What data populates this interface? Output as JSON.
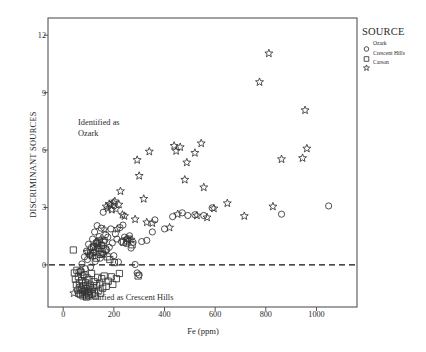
{
  "chart_data": {
    "type": "scatter",
    "title": "",
    "xlabel": "Fe (ppm)",
    "ylabel": "DISCRIMINANT SOURCES",
    "xlim": [
      -60,
      1160
    ],
    "ylim": [
      -2.2,
      12.9
    ],
    "xticks": [
      0,
      200,
      400,
      600,
      800,
      1000
    ],
    "yticks": [
      0,
      3,
      6,
      9,
      12
    ],
    "xtick_labels": [
      "0",
      "200",
      "400",
      "600",
      "800",
      "1000"
    ],
    "ytick_labels": [
      "0",
      "3",
      "6",
      "9",
      "12"
    ],
    "grid": false,
    "legend_position": "outside-top-right",
    "reference_lines": [
      {
        "name": "zero-discriminant-line",
        "axis": "y",
        "value": 0,
        "style": "dashed"
      }
    ],
    "annotations": [
      {
        "name": "identified-as-ozark",
        "text": "Identified as\nOzark",
        "x": 110,
        "y": 7.4
      },
      {
        "name": "identified-as-crescent-hills",
        "text": "Identified as Crescent Hills",
        "x": 260,
        "y": -1.95
      }
    ],
    "series": [
      {
        "name": "Ozark",
        "marker": "circle",
        "points": [
          [
            62,
            -0.35
          ],
          [
            70,
            -0.3
          ],
          [
            74,
            0.05
          ],
          [
            78,
            -0.55
          ],
          [
            84,
            0.42
          ],
          [
            88,
            -0.2
          ],
          [
            92,
            0.72
          ],
          [
            96,
            0.28
          ],
          [
            100,
            1.08
          ],
          [
            104,
            0.52
          ],
          [
            108,
            -0.12
          ],
          [
            112,
            0.92
          ],
          [
            116,
            1.35
          ],
          [
            120,
            0.62
          ],
          [
            124,
            1.72
          ],
          [
            126,
            0.18
          ],
          [
            130,
            1.18
          ],
          [
            134,
            2.05
          ],
          [
            138,
            0.85
          ],
          [
            142,
            1.48
          ],
          [
            146,
            0.35
          ],
          [
            150,
            1.92
          ],
          [
            154,
            1.02
          ],
          [
            158,
            2.75
          ],
          [
            160,
            0.58
          ],
          [
            164,
            1.28
          ],
          [
            168,
            1.58
          ],
          [
            172,
            0.78
          ],
          [
            176,
            1.45
          ],
          [
            182,
            0.92
          ],
          [
            188,
            1.88
          ],
          [
            194,
            1.15
          ],
          [
            200,
            0.48
          ],
          [
            206,
            1.62
          ],
          [
            212,
            1.35
          ],
          [
            218,
            0.15
          ],
          [
            224,
            1.95
          ],
          [
            230,
            1.22
          ],
          [
            236,
            2.08
          ],
          [
            242,
            1.45
          ],
          [
            248,
            1.12
          ],
          [
            254,
            1.38
          ],
          [
            262,
            1.52
          ],
          [
            268,
            0.88
          ],
          [
            276,
            1.18
          ],
          [
            284,
            0.02
          ],
          [
            292,
            -0.42
          ],
          [
            300,
            -0.52
          ],
          [
            310,
            1.22
          ],
          [
            330,
            1.28
          ],
          [
            352,
            1.72
          ],
          [
            362,
            2.35
          ],
          [
            400,
            1.88
          ],
          [
            432,
            2.52
          ],
          [
            470,
            2.72
          ],
          [
            492,
            2.58
          ],
          [
            520,
            2.62
          ],
          [
            555,
            2.58
          ],
          [
            588,
            2.98
          ],
          [
            862,
            2.65
          ],
          [
            1048,
            3.08
          ]
        ]
      },
      {
        "name": "Crescent Hills",
        "marker": "square",
        "points": [
          [
            40,
            0.78
          ],
          [
            44,
            -0.42
          ],
          [
            48,
            -0.75
          ],
          [
            52,
            -1.05
          ],
          [
            54,
            -0.28
          ],
          [
            58,
            -1.32
          ],
          [
            60,
            -0.62
          ],
          [
            62,
            -1.48
          ],
          [
            64,
            -0.95
          ],
          [
            66,
            -1.18
          ],
          [
            68,
            -1.55
          ],
          [
            70,
            -0.38
          ],
          [
            72,
            -1.28
          ],
          [
            74,
            -0.82
          ],
          [
            76,
            -1.42
          ],
          [
            78,
            -1.62
          ],
          [
            80,
            -1.08
          ],
          [
            82,
            -0.52
          ],
          [
            84,
            -1.35
          ],
          [
            86,
            -1.52
          ],
          [
            88,
            -0.92
          ],
          [
            90,
            -1.22
          ],
          [
            92,
            -1.68
          ],
          [
            94,
            -0.68
          ],
          [
            96,
            -1.45
          ],
          [
            98,
            -1.15
          ],
          [
            100,
            -1.58
          ],
          [
            102,
            -0.78
          ],
          [
            104,
            -1.38
          ],
          [
            106,
            -1.05
          ],
          [
            108,
            0.62
          ],
          [
            110,
            -1.28
          ],
          [
            112,
            -0.45
          ],
          [
            114,
            -1.52
          ],
          [
            116,
            0.48
          ],
          [
            118,
            -1.18
          ],
          [
            120,
            0.95
          ],
          [
            122,
            -0.88
          ],
          [
            124,
            -1.42
          ],
          [
            126,
            0.72
          ],
          [
            128,
            -1.62
          ],
          [
            130,
            0.35
          ],
          [
            132,
            -1.08
          ],
          [
            134,
            1.12
          ],
          [
            136,
            -0.65
          ],
          [
            138,
            0.88
          ],
          [
            140,
            -1.35
          ],
          [
            142,
            1.25
          ],
          [
            144,
            -0.95
          ],
          [
            146,
            0.55
          ],
          [
            148,
            -1.48
          ],
          [
            150,
            1.02
          ],
          [
            152,
            -0.72
          ],
          [
            154,
            0.68
          ],
          [
            156,
            -1.22
          ],
          [
            158,
            1.18
          ],
          [
            162,
            -0.58
          ],
          [
            166,
            0.82
          ],
          [
            170,
            -1.12
          ],
          [
            174,
            0.42
          ],
          [
            178,
            -0.85
          ],
          [
            184,
            0.28
          ],
          [
            190,
            -0.62
          ],
          [
            196,
            -1.02
          ],
          [
            202,
            0.12
          ],
          [
            210,
            -0.72
          ],
          [
            222,
            -0.45
          ],
          [
            238,
            1.18
          ],
          [
            252,
            1.25
          ],
          [
            272,
            1.05
          ],
          [
            296,
            -0.58
          ]
        ]
      },
      {
        "name": "Carson",
        "marker": "star",
        "points": [
          [
            42,
            -1.48
          ],
          [
            96,
            0.68
          ],
          [
            112,
            0.48
          ],
          [
            124,
            0.92
          ],
          [
            136,
            1.08
          ],
          [
            148,
            1.32
          ],
          [
            156,
            0.55
          ],
          [
            162,
            1.85
          ],
          [
            170,
            3.05
          ],
          [
            176,
            2.95
          ],
          [
            182,
            3.18
          ],
          [
            188,
            3.12
          ],
          [
            192,
            2.88
          ],
          [
            198,
            3.25
          ],
          [
            204,
            3.32
          ],
          [
            208,
            2.92
          ],
          [
            214,
            1.88
          ],
          [
            220,
            3.15
          ],
          [
            226,
            3.85
          ],
          [
            234,
            2.62
          ],
          [
            242,
            2.55
          ],
          [
            250,
            1.35
          ],
          [
            258,
            1.28
          ],
          [
            268,
            1.32
          ],
          [
            284,
            2.38
          ],
          [
            292,
            5.48
          ],
          [
            300,
            4.65
          ],
          [
            318,
            3.45
          ],
          [
            330,
            2.22
          ],
          [
            340,
            5.92
          ],
          [
            352,
            2.18
          ],
          [
            420,
            1.95
          ],
          [
            438,
            6.22
          ],
          [
            446,
            5.95
          ],
          [
            452,
            2.65
          ],
          [
            462,
            6.15
          ],
          [
            480,
            4.45
          ],
          [
            488,
            5.35
          ],
          [
            520,
            5.85
          ],
          [
            528,
            2.58
          ],
          [
            545,
            6.35
          ],
          [
            555,
            4.05
          ],
          [
            568,
            2.48
          ],
          [
            595,
            2.95
          ],
          [
            648,
            3.22
          ],
          [
            715,
            2.55
          ],
          [
            775,
            9.55
          ],
          [
            812,
            11.05
          ],
          [
            828,
            3.05
          ],
          [
            862,
            5.52
          ],
          [
            945,
            5.58
          ],
          [
            955,
            8.08
          ],
          [
            962,
            6.08
          ]
        ]
      }
    ]
  },
  "legend": {
    "title": "SOURCE",
    "items": [
      {
        "label": "Ozark",
        "marker": "circle"
      },
      {
        "label": "Crescent Hills",
        "marker": "square"
      },
      {
        "label": "Carson",
        "marker": "star"
      }
    ]
  }
}
